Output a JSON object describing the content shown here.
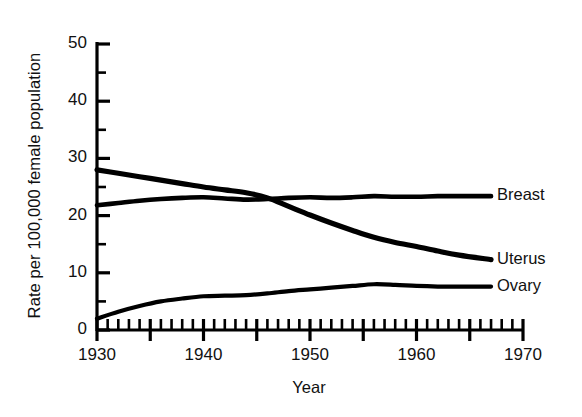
{
  "chart_data": {
    "type": "line",
    "title": "",
    "xlabel": "Year",
    "ylabel": "Rate per 100,000 female population",
    "xlim": [
      1930,
      1970
    ],
    "ylim": [
      0,
      50
    ],
    "ytick_labels": [
      "0",
      "10",
      "20",
      "30",
      "40",
      "50"
    ],
    "ytick_values": [
      0,
      10,
      20,
      30,
      40,
      50
    ],
    "yminor_step": 5,
    "xtick_labels": [
      "1930",
      "1940",
      "1950",
      "1960",
      "1970"
    ],
    "xtick_values": [
      1930,
      1940,
      1950,
      1960,
      1970
    ],
    "xminor_step": 1,
    "grid": false,
    "legend_position": "right-inline",
    "line_color": "#000000",
    "axis_color": "#000000",
    "x": [
      1930,
      1932,
      1934,
      1936,
      1938,
      1940,
      1942,
      1944,
      1946,
      1948,
      1950,
      1952,
      1954,
      1956,
      1958,
      1960,
      1962,
      1964,
      1967
    ],
    "series": [
      {
        "name": "Breast",
        "label": "Breast",
        "values": [
          21.8,
          22.2,
          22.6,
          22.9,
          23.1,
          23.2,
          23.0,
          22.8,
          22.9,
          23.1,
          23.2,
          23.1,
          23.2,
          23.4,
          23.3,
          23.3,
          23.4,
          23.4,
          23.4
        ]
      },
      {
        "name": "Uterus",
        "label": "Uterus",
        "values": [
          28.0,
          27.4,
          26.8,
          26.2,
          25.6,
          25.0,
          24.5,
          24.0,
          23.1,
          21.6,
          20.1,
          18.7,
          17.4,
          16.2,
          15.3,
          14.6,
          13.8,
          13.1,
          12.3
        ]
      },
      {
        "name": "Ovary",
        "label": "Ovary",
        "values": [
          2.0,
          3.2,
          4.2,
          5.0,
          5.5,
          5.9,
          6.0,
          6.1,
          6.4,
          6.8,
          7.1,
          7.4,
          7.7,
          8.0,
          7.9,
          7.7,
          7.6,
          7.6,
          7.6
        ]
      }
    ]
  }
}
